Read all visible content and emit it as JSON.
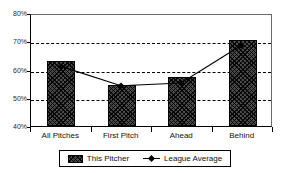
{
  "title_fragment": "Strike Percentage",
  "chart_data": {
    "type": "bar",
    "title": "",
    "xlabel": "",
    "ylabel": "",
    "categories": [
      "All Pitches",
      "First Pitch",
      "Ahead",
      "Behind"
    ],
    "ylim": [
      40,
      80
    ],
    "y_ticks": [
      "40%",
      "50%",
      "60%",
      "70%",
      "80%"
    ],
    "y_tick_values": [
      40,
      50,
      60,
      70,
      80
    ],
    "grid": "horizontal-dashed",
    "legend_position": "bottom",
    "series": [
      {
        "name": "This Pitcher",
        "type": "bar",
        "values": [
          63,
          54.5,
          57.5,
          70.5
        ]
      },
      {
        "name": "League Average",
        "type": "line",
        "values": [
          61.5,
          54.5,
          55.5,
          69
        ]
      }
    ]
  },
  "legend": {
    "entries": [
      {
        "label": "This Pitcher",
        "marker": "hatched-bar-swatch"
      },
      {
        "label": "League Average",
        "marker": "line-with-diamond-marker"
      }
    ]
  }
}
